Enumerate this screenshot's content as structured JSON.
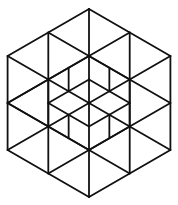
{
  "figure": {
    "stroke_color": "#111111",
    "background": "#ffffff",
    "center": [
      89,
      103
    ],
    "outer_radius": 94
  }
}
